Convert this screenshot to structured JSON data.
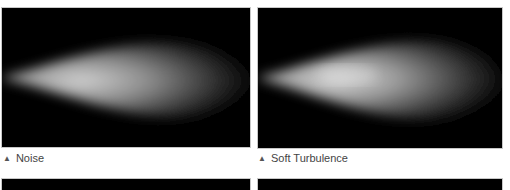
{
  "figures": [
    {
      "caption": "Noise",
      "marker": "▲"
    },
    {
      "caption": "Soft Turbulence",
      "marker": "▲"
    }
  ],
  "colors": {
    "background": "#ffffff",
    "panel": "#000000",
    "caption": "#444444"
  }
}
